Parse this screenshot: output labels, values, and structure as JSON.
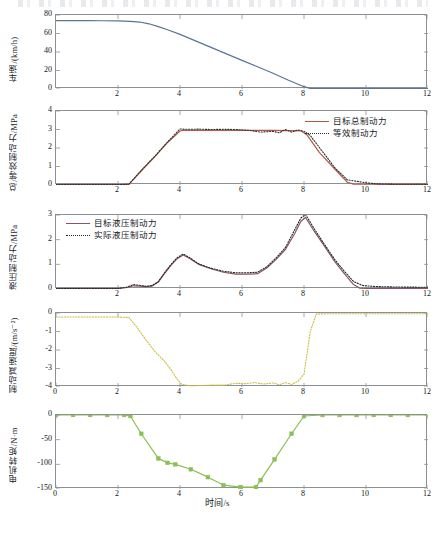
{
  "figure": {
    "xlabel": "时间/s",
    "x_ticks": [
      "0",
      "2",
      "4",
      "6",
      "8",
      "10",
      "12"
    ],
    "xlim": [
      0,
      12
    ]
  },
  "colors": {
    "speed_line": "#5a7494",
    "target_total": "#b35a3f",
    "equivalent": "#2c2f36",
    "target_hydraulic": "#8b5560",
    "actual_hydraulic": "#22252b",
    "deceleration": "#cbbe3c",
    "motor_torque": "#8bbf55",
    "axis": "#8c8f96"
  },
  "chart_data": [
    {
      "id": "panel-speed",
      "type": "line",
      "title": "",
      "xlabel": "",
      "ylabel": "车速/(km/h)",
      "xlim": [
        0,
        12
      ],
      "ylim": [
        0,
        80
      ],
      "y_ticks": [
        "0",
        "20",
        "40",
        "60",
        "80"
      ],
      "x_ticks": [
        "2",
        "4",
        "6",
        "8",
        "10",
        "12"
      ],
      "grid": false,
      "legend": [],
      "series": [
        {
          "name": "车速",
          "style": "solid",
          "color": "#5a7494",
          "x": [
            0,
            0.5,
            1.0,
            1.5,
            2.0,
            2.4,
            2.7,
            3.0,
            3.3,
            3.6,
            4.0,
            4.5,
            5.0,
            5.5,
            6.0,
            6.5,
            7.0,
            7.5,
            8.0,
            8.2,
            8.5,
            9.0,
            10.0,
            11.0,
            12.0
          ],
          "values": [
            74,
            74,
            74,
            73.8,
            73.6,
            73.2,
            72.4,
            70.5,
            67.5,
            64.0,
            59.0,
            52.0,
            45.0,
            38.0,
            31.0,
            24.0,
            17.0,
            9.5,
            2.5,
            0.6,
            0.4,
            0.4,
            0.4,
            0.4,
            0.4
          ]
        }
      ]
    },
    {
      "id": "panel-total-braking",
      "type": "line",
      "title": "",
      "xlabel": "",
      "ylabel": "总/等效制动力/MPa",
      "xlim": [
        0,
        12
      ],
      "ylim": [
        0,
        4
      ],
      "y_ticks": [
        "0",
        "1",
        "2",
        "3",
        "4"
      ],
      "x_ticks": [
        "2",
        "4",
        "6",
        "8",
        "10",
        "12"
      ],
      "grid": false,
      "legend": [
        {
          "label": "目标总制动力",
          "style": "solid",
          "color": "#b35a3f"
        },
        {
          "label": "等效制动力",
          "style": "dotted",
          "color": "#2c2f36"
        }
      ],
      "series": [
        {
          "name": "目标总制动力",
          "style": "solid",
          "color": "#b35a3f",
          "x": [
            0,
            1.0,
            2.0,
            2.35,
            2.8,
            3.2,
            3.6,
            4.0,
            4.1,
            5.0,
            6.0,
            7.0,
            7.9,
            8.1,
            8.5,
            9.0,
            9.4,
            9.6,
            10.0,
            11.0,
            12.0
          ],
          "values": [
            0.02,
            0.02,
            0.02,
            0.03,
            0.85,
            1.55,
            2.3,
            2.92,
            2.96,
            2.95,
            2.95,
            2.95,
            2.93,
            2.7,
            1.75,
            0.85,
            0.15,
            0.05,
            0.04,
            0.03,
            0.03
          ]
        },
        {
          "name": "等效制动力",
          "style": "dotted",
          "color": "#2c2f36",
          "x": [
            0,
            1.0,
            2.0,
            2.35,
            2.8,
            3.2,
            3.6,
            4.0,
            4.2,
            4.6,
            5.0,
            5.4,
            5.8,
            6.2,
            6.6,
            7.0,
            7.2,
            7.4,
            7.6,
            7.8,
            8.0,
            8.2,
            8.6,
            9.0,
            9.4,
            9.7,
            10.0,
            10.4,
            11.0,
            12.0
          ],
          "values": [
            0.02,
            0.02,
            0.02,
            0.04,
            0.88,
            1.58,
            2.33,
            3.03,
            3.01,
            3.02,
            3.0,
            3.01,
            3.0,
            2.96,
            2.86,
            2.9,
            2.82,
            3.0,
            2.86,
            2.98,
            2.9,
            2.68,
            1.8,
            0.92,
            0.28,
            0.2,
            0.12,
            0.06,
            0.04,
            0.04
          ]
        }
      ]
    },
    {
      "id": "panel-hydraulic-braking",
      "type": "line",
      "title": "",
      "xlabel": "",
      "ylabel": "液压制动力/MPa",
      "xlim": [
        0,
        12
      ],
      "ylim": [
        0,
        3
      ],
      "y_ticks": [
        "0",
        "1",
        "2",
        "3"
      ],
      "x_ticks": [
        "2",
        "4",
        "6",
        "8",
        "10",
        "12"
      ],
      "grid": false,
      "legend": [
        {
          "label": "目标液压制动力",
          "style": "solid",
          "color": "#8b5560"
        },
        {
          "label": "实际液压制动力",
          "style": "dotted",
          "color": "#22252b"
        }
      ],
      "series": [
        {
          "name": "目标液压制动力",
          "style": "solid",
          "color": "#8b5560",
          "x": [
            0,
            1.0,
            2.0,
            2.3,
            2.5,
            2.7,
            2.9,
            3.1,
            3.3,
            3.5,
            3.7,
            3.9,
            4.1,
            4.3,
            4.6,
            5.0,
            5.4,
            5.8,
            6.2,
            6.5,
            6.8,
            7.1,
            7.4,
            7.7,
            7.9,
            8.05,
            8.3,
            8.6,
            9.0,
            9.3,
            9.6,
            9.8,
            10.2,
            11.0,
            12.0
          ],
          "values": [
            0.02,
            0.02,
            0.02,
            0.06,
            0.13,
            0.12,
            0.1,
            0.12,
            0.28,
            0.62,
            0.95,
            1.22,
            1.38,
            1.25,
            1.0,
            0.82,
            0.68,
            0.6,
            0.6,
            0.62,
            0.85,
            1.2,
            1.6,
            2.25,
            2.75,
            2.9,
            2.4,
            1.85,
            1.1,
            0.62,
            0.18,
            0.03,
            0.02,
            0.02,
            0.02
          ]
        },
        {
          "name": "实际液压制动力",
          "style": "dotted",
          "color": "#22252b",
          "x": [
            0,
            1.0,
            2.0,
            2.3,
            2.5,
            2.7,
            2.9,
            3.1,
            3.3,
            3.5,
            3.7,
            3.9,
            4.1,
            4.3,
            4.6,
            5.0,
            5.4,
            5.8,
            6.2,
            6.5,
            6.8,
            7.1,
            7.4,
            7.7,
            7.9,
            8.05,
            8.3,
            8.6,
            9.0,
            9.3,
            9.6,
            9.9,
            10.3,
            11.0,
            12.0
          ],
          "values": [
            0.02,
            0.02,
            0.02,
            0.08,
            0.18,
            0.15,
            0.11,
            0.14,
            0.3,
            0.66,
            0.98,
            1.26,
            1.42,
            1.28,
            1.02,
            0.84,
            0.72,
            0.66,
            0.66,
            0.68,
            0.9,
            1.26,
            1.68,
            2.4,
            2.88,
            3.02,
            2.5,
            1.92,
            1.18,
            0.72,
            0.3,
            0.14,
            0.1,
            0.08,
            0.07
          ]
        }
      ]
    },
    {
      "id": "panel-deceleration",
      "type": "line",
      "title": "",
      "xlabel": "",
      "ylabel": "制动减速度/(m/s⁻²)",
      "xlim": [
        0,
        12
      ],
      "ylim": [
        -4,
        0
      ],
      "y_ticks": [
        "0",
        "-1",
        "-2",
        "-3",
        "-4"
      ],
      "x_ticks": [
        "0",
        "2",
        "4",
        "6",
        "8",
        "10",
        "12"
      ],
      "grid": false,
      "legend": [],
      "series": [
        {
          "name": "制动减速度",
          "style": "dotted",
          "color": "#cbbe3c",
          "x": [
            0,
            1.0,
            2.0,
            2.35,
            2.6,
            2.9,
            3.2,
            3.5,
            3.7,
            3.9,
            4.05,
            4.3,
            4.7,
            5.0,
            5.4,
            5.8,
            6.1,
            6.4,
            6.7,
            7.0,
            7.2,
            7.4,
            7.6,
            7.8,
            8.0,
            8.1,
            8.2,
            8.4,
            9.0,
            10.0,
            11.0,
            12.0
          ],
          "values": [
            -0.22,
            -0.22,
            -0.22,
            -0.24,
            -0.75,
            -1.45,
            -2.1,
            -2.6,
            -3.05,
            -3.55,
            -3.85,
            -3.93,
            -3.92,
            -3.9,
            -3.9,
            -3.8,
            -3.82,
            -3.76,
            -3.84,
            -3.78,
            -3.88,
            -3.76,
            -3.86,
            -3.7,
            -3.3,
            -2.2,
            -1.0,
            -0.05,
            -0.04,
            -0.04,
            -0.04,
            -0.04
          ]
        }
      ]
    },
    {
      "id": "panel-motor-torque",
      "type": "line",
      "title": "",
      "xlabel": "时间/s",
      "ylabel": "电机转矩/N·m",
      "xlim": [
        0,
        12
      ],
      "ylim": [
        -150,
        0
      ],
      "y_ticks": [
        "0",
        "-50",
        "-100",
        "-150"
      ],
      "x_ticks": [
        "0",
        "2",
        "4",
        "6",
        "8",
        "10",
        "12"
      ],
      "grid": false,
      "markers": "square",
      "legend": [],
      "series": [
        {
          "name": "电机转矩",
          "style": "solid-markers",
          "color": "#8bbf55",
          "x": [
            0,
            0.55,
            1.1,
            1.65,
            2.2,
            2.4,
            2.75,
            3.3,
            3.6,
            3.85,
            4.35,
            4.9,
            5.4,
            5.95,
            6.45,
            6.6,
            7.05,
            7.6,
            8.0,
            8.6,
            9.15,
            9.7,
            10.25,
            10.8,
            11.35,
            12.0
          ],
          "values": [
            0,
            0,
            0,
            0,
            0,
            -2,
            -38,
            -88,
            -97,
            -100,
            -110,
            -126,
            -142,
            -146,
            -146,
            -132,
            -90,
            -38,
            -2,
            0,
            0,
            0,
            0,
            0,
            0,
            0
          ]
        }
      ]
    }
  ]
}
